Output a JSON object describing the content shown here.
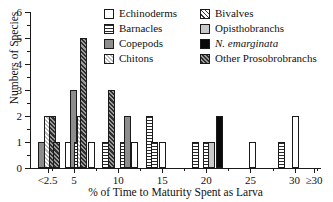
{
  "chart_data": {
    "type": "bar",
    "title": "",
    "xlabel": "% of Time to Maturity Spent as Larva",
    "ylabel": "Numbers of Species",
    "xlim": [
      0,
      33
    ],
    "ylim": [
      0,
      6
    ],
    "grid": false,
    "legend_position": "top-right",
    "y_ticks": [
      "0",
      "1",
      "2",
      "3",
      "4",
      "5",
      "6"
    ],
    "x_ticks": [
      "<2.5",
      "5",
      "10",
      "15",
      "20",
      "25",
      "30",
      "≥30"
    ],
    "x_tick_values": [
      2.0,
      5,
      10,
      15,
      20,
      25,
      30,
      32.2
    ],
    "series": [
      {
        "name": "Echinoderms",
        "pattern": "white",
        "color": "#ffffff"
      },
      {
        "name": "Barnacles",
        "pattern": "horizontal-lines",
        "color": "#2b2b2b"
      },
      {
        "name": "Copepods",
        "pattern": "solid-gray",
        "color": "#8d8d8d"
      },
      {
        "name": "Chitons",
        "pattern": "light-crosshatch",
        "color": "#bdbdbd"
      },
      {
        "name": "Bivalves",
        "pattern": "diagonal-hatch",
        "color": "#3a3a3a"
      },
      {
        "name": "Opisthobranchs",
        "pattern": "light-gray",
        "color": "#c9c9c9"
      },
      {
        "name": "N. emarginata",
        "pattern": "solid-black",
        "color": "#0a0a0a"
      },
      {
        "name": "Other Prosobrobranchs",
        "pattern": "dark-crosshatch",
        "color": "#555555"
      }
    ],
    "bars": [
      {
        "x": 1.35,
        "value": 1,
        "group": "Copepods"
      },
      {
        "x": 1.95,
        "value": 2,
        "group": "Chitons"
      },
      {
        "x": 2.55,
        "value": 2,
        "group": "Other Prosobrobranchs"
      },
      {
        "x": 3.05,
        "value": 1,
        "group": "Other Prosobrobranchs"
      },
      {
        "x": 4.35,
        "value": 1,
        "group": "Echinoderms"
      },
      {
        "x": 4.95,
        "value": 3,
        "group": "Copepods"
      },
      {
        "x": 5.35,
        "value": 1,
        "group": "Barnacles"
      },
      {
        "x": 5.7,
        "value": 2,
        "group": "Chitons"
      },
      {
        "x": 6.1,
        "value": 5,
        "group": "Other Prosobrobranchs"
      },
      {
        "x": 6.95,
        "value": 1,
        "group": "Echinoderms"
      },
      {
        "x": 8.6,
        "value": 1,
        "group": "Barnacles"
      },
      {
        "x": 9.25,
        "value": 3,
        "group": "Other Prosobrobranchs"
      },
      {
        "x": 10.55,
        "value": 1,
        "group": "Barnacles"
      },
      {
        "x": 11.05,
        "value": 2,
        "group": "Copepods"
      },
      {
        "x": 11.85,
        "value": 1,
        "group": "Echinoderms"
      },
      {
        "x": 13.55,
        "value": 2,
        "group": "Barnacles"
      },
      {
        "x": 14.1,
        "value": 1,
        "group": "Barnacles"
      },
      {
        "x": 15.05,
        "value": 1,
        "group": "Echinoderms"
      },
      {
        "x": 18.8,
        "value": 1,
        "group": "Barnacles"
      },
      {
        "x": 20.05,
        "value": 1,
        "group": "Barnacles"
      },
      {
        "x": 20.6,
        "value": 1,
        "group": "Opisthobranchs"
      },
      {
        "x": 21.5,
        "value": 2,
        "group": "N. emarginata"
      },
      {
        "x": 25.2,
        "value": 1,
        "group": "Echinoderms"
      },
      {
        "x": 28.55,
        "value": 1,
        "group": "Barnacles"
      },
      {
        "x": 30.1,
        "value": 2,
        "group": "Echinoderms"
      }
    ]
  },
  "legend": {
    "items": [
      {
        "label": "Echinoderms",
        "swatch": "p-echinoderms",
        "italic": false
      },
      {
        "label": "Bivalves",
        "swatch": "p-bivalves",
        "italic": false
      },
      {
        "label": "Barnacles",
        "swatch": "p-barnacles",
        "italic": false
      },
      {
        "label": "Opisthobranchs",
        "swatch": "p-opisthobranchs",
        "italic": false
      },
      {
        "label": "Copepods",
        "swatch": "p-copepods",
        "italic": false
      },
      {
        "label": "N. emarginata",
        "swatch": "p-nemarginata",
        "italic": true
      },
      {
        "label": "Chitons",
        "swatch": "p-chitons",
        "italic": false
      },
      {
        "label": "Other Prosobrobranchs",
        "swatch": "p-prosobrobranchs",
        "italic": false
      }
    ]
  }
}
